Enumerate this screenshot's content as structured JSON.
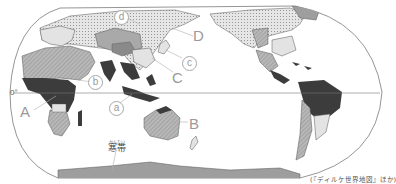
{
  "map": {
    "type": "world climate zone map",
    "projection": "oval, Pacific-centered",
    "equator_label": "0°",
    "region_labels": [
      "A",
      "B",
      "C",
      "D"
    ],
    "circled_labels": [
      "a",
      "b",
      "c",
      "d"
    ],
    "cold_zone_label": "寒帯",
    "cold_zone_ruby": "かんたい",
    "source": "(『ディルケ世界地図』ほか)"
  },
  "labels": {
    "A": "A",
    "B": "B",
    "C": "C",
    "D": "D",
    "a": "a",
    "b": "b",
    "c": "c",
    "d": "d"
  },
  "colors": {
    "ocean": "#ffffff",
    "outline": "#555555",
    "tropical": "#3c3c3c",
    "dry": "#a9a9a9",
    "temperate": "#e3e3e3",
    "subarctic": "#cfcfcf",
    "cold": "#9e9e9e",
    "highland": "#8a8a8a",
    "label": "#9a9a9a"
  }
}
